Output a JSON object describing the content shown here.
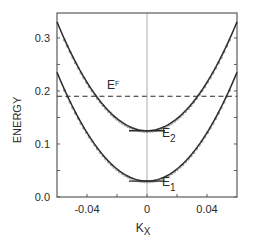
{
  "chart_data": {
    "type": "line",
    "title": "",
    "xlabel": "K",
    "xlabel_subscript": "X",
    "ylabel": "ENERGY",
    "xlim": [
      -0.06,
      0.06
    ],
    "ylim": [
      0.0,
      0.347
    ],
    "grid": false,
    "legend": "none",
    "x_ticks": [
      -0.04,
      -0.02,
      0,
      0.02,
      0.04
    ],
    "x_tick_labels": [
      {
        "value": -0.04,
        "label": "-0.04"
      },
      {
        "value": 0,
        "label": "0"
      },
      {
        "value": 0.04,
        "label": "0.04"
      }
    ],
    "y_ticks": [
      0.0,
      0.05,
      0.1,
      0.15,
      0.2,
      0.25,
      0.3
    ],
    "y_tick_labels": [
      {
        "value": 0.0,
        "label": "0.0"
      },
      {
        "value": 0.1,
        "label": "0.1"
      },
      {
        "value": 0.2,
        "label": "0.2"
      },
      {
        "value": 0.3,
        "label": "0.3"
      }
    ],
    "series": [
      {
        "name": "upper subband (E2)",
        "style": "solid with scatter markers",
        "model": "E = 0.125 + 57*k^2",
        "x": [
          -0.06,
          -0.05,
          -0.04,
          -0.03,
          -0.02,
          -0.01,
          0.0,
          0.01,
          0.02,
          0.03,
          0.04,
          0.05,
          0.06
        ],
        "values": [
          0.33,
          0.268,
          0.216,
          0.176,
          0.148,
          0.131,
          0.125,
          0.131,
          0.148,
          0.176,
          0.216,
          0.268,
          0.33
        ]
      },
      {
        "name": "lower subband (E1)",
        "style": "solid with scatter markers",
        "model": "E = 0.03 + 57*k^2",
        "x": [
          -0.06,
          -0.05,
          -0.04,
          -0.03,
          -0.02,
          -0.01,
          0.0,
          0.01,
          0.02,
          0.03,
          0.04,
          0.05,
          0.06
        ],
        "values": [
          0.235,
          0.173,
          0.121,
          0.081,
          0.053,
          0.036,
          0.03,
          0.036,
          0.053,
          0.081,
          0.121,
          0.173,
          0.235
        ]
      }
    ],
    "reference_lines": [
      {
        "name": "E_F",
        "type": "horizontal",
        "y": 0.19,
        "style": "dashed"
      },
      {
        "name": "k=0",
        "type": "vertical",
        "x": 0.0,
        "style": "thin solid"
      }
    ],
    "annotations": [
      {
        "text": "E",
        "subscript": "F",
        "x": -0.023,
        "y": 0.2
      },
      {
        "text": "E",
        "subscript": "2",
        "x": 0.015,
        "y": 0.125,
        "marker": "flat line from -0.012 to 0.012"
      },
      {
        "text": "E",
        "subscript": "1",
        "x": 0.015,
        "y": 0.03,
        "marker": "flat line from -0.012 to 0.012"
      }
    ],
    "curvature": 57,
    "minima": {
      "E1": 0.03,
      "E2": 0.125
    },
    "fermi_level": 0.19
  },
  "colors": {
    "axis": "#5a5a5a",
    "curve": "#2a2a2a",
    "text": "#2a2a2a",
    "background": "#ffffff"
  }
}
